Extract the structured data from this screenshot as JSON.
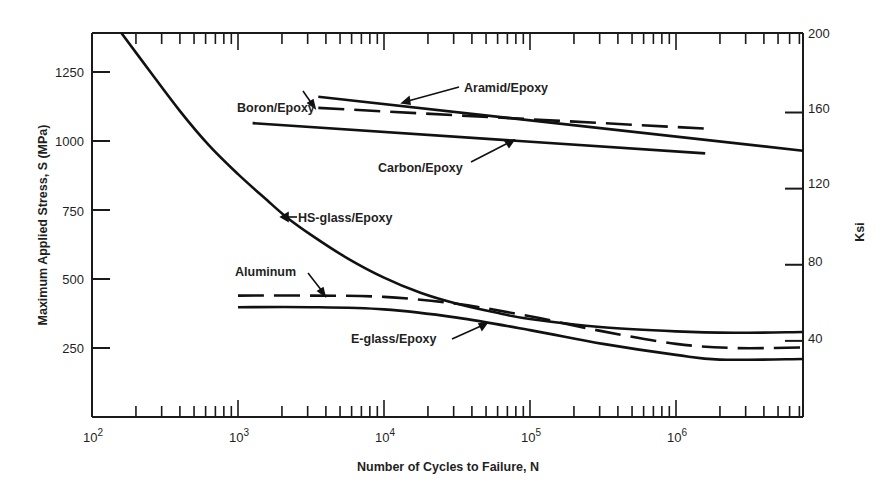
{
  "chart_data": {
    "type": "line",
    "title": "",
    "xlabel": "Number of Cycles to Failure, N",
    "ylabel": "Maximum Applied Stress, S (MPa)",
    "y2label": "Ksi",
    "xscale": "log",
    "xlim_log10": [
      2,
      6.87
    ],
    "ylim": [
      0,
      1392
    ],
    "x_tick_labels": [
      {
        "exp": 2,
        "base": "10",
        "sup": "2"
      },
      {
        "exp": 3,
        "base": "10",
        "sup": "3"
      },
      {
        "exp": 4,
        "base": "10",
        "sup": "4"
      },
      {
        "exp": 5,
        "base": "10",
        "sup": "5"
      },
      {
        "exp": 6,
        "base": "10",
        "sup": "6"
      }
    ],
    "y_ticks": [
      250,
      500,
      750,
      1000,
      1250
    ],
    "y2_ticks": [
      40,
      80,
      120,
      160,
      200
    ],
    "grid": false,
    "legend": "inline annotations with arrows",
    "series": [
      {
        "name": "HS-glass/Epoxy",
        "style": "solid",
        "points_log10N_MPa": [
          [
            2.2,
            1392
          ],
          [
            2.4,
            1250
          ],
          [
            2.6,
            1110
          ],
          [
            2.8,
            985
          ],
          [
            3.0,
            880
          ],
          [
            3.2,
            785
          ],
          [
            3.33,
            725
          ],
          [
            3.5,
            660
          ],
          [
            3.75,
            575
          ],
          [
            4.0,
            505
          ],
          [
            4.25,
            450
          ],
          [
            4.5,
            410
          ],
          [
            4.75,
            380
          ],
          [
            5.0,
            355
          ],
          [
            5.5,
            325
          ],
          [
            6.0,
            310
          ],
          [
            6.4,
            305
          ],
          [
            6.87,
            308
          ]
        ]
      },
      {
        "name": "Aluminum",
        "style": "dashed",
        "points_log10N_MPa": [
          [
            3.0,
            440
          ],
          [
            3.5,
            440
          ],
          [
            4.0,
            435
          ],
          [
            4.5,
            410
          ],
          [
            5.0,
            365
          ],
          [
            5.5,
            310
          ],
          [
            6.0,
            265
          ],
          [
            6.4,
            250
          ],
          [
            6.87,
            252
          ]
        ]
      },
      {
        "name": "E-glass/Epoxy",
        "style": "solid",
        "points_log10N_MPa": [
          [
            3.0,
            398
          ],
          [
            3.5,
            398
          ],
          [
            4.0,
            390
          ],
          [
            4.5,
            360
          ],
          [
            5.0,
            315
          ],
          [
            5.5,
            265
          ],
          [
            6.0,
            225
          ],
          [
            6.3,
            208
          ],
          [
            6.87,
            210
          ]
        ]
      },
      {
        "name": "Carbon/Epoxy",
        "style": "solid",
        "points_log10N_MPa": [
          [
            3.1,
            1065
          ],
          [
            6.2,
            955
          ]
        ]
      },
      {
        "name": "Aramid/Epoxy",
        "style": "solid",
        "points_log10N_MPa": [
          [
            3.55,
            1160
          ],
          [
            6.87,
            965
          ]
        ]
      },
      {
        "name": "Boron/Epoxy",
        "style": "dashed",
        "points_log10N_MPa": [
          [
            3.55,
            1120
          ],
          [
            6.2,
            1045
          ]
        ]
      }
    ],
    "annotations": [
      {
        "text": "Boron/Epoxy",
        "x": 237,
        "y": 112
      },
      {
        "text": "Aramid/Epoxy",
        "x": 464,
        "y": 92
      },
      {
        "text": "Carbon/Epoxy",
        "x": 378,
        "y": 172
      },
      {
        "text": "HS-glass/Epoxy",
        "x": 286,
        "y": 222
      },
      {
        "text": "Aluminum",
        "x": 235,
        "y": 276
      },
      {
        "text": "E-glass/Epoxy",
        "x": 351,
        "y": 343
      }
    ]
  },
  "labels": {
    "boron": "Boron/Epoxy",
    "aramid": "Aramid/Epoxy",
    "carbon": "Carbon/Epoxy",
    "hsglass": "HS-glass/Epoxy",
    "aluminum": "Aluminum",
    "eglass": "E-glass/Epoxy",
    "xlabel": "Number of Cycles to Failure, N",
    "ylabel": "Maximum Applied Stress, S (MPa)",
    "y2label": "Ksi",
    "yticks": [
      "1250",
      "1000",
      "750",
      "500",
      "250"
    ],
    "y2ticks": [
      "200",
      "160",
      "120",
      "80",
      "40"
    ],
    "xticks_base": "10",
    "xticks_sup": [
      "2",
      "3",
      "4",
      "5",
      "6"
    ]
  }
}
